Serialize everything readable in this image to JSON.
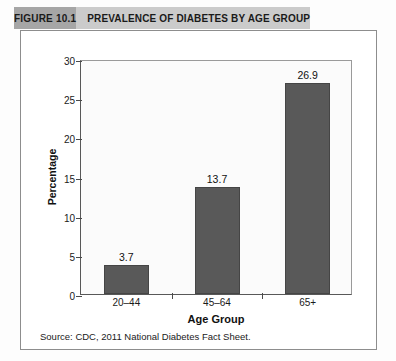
{
  "header": {
    "figure_number": "FIGURE 10.1",
    "title": "PREVALENCE OF DIABETES BY AGE GROUP",
    "number_block_color": "#a6a6a6",
    "title_block_color": "#cbcbcb"
  },
  "source_note": "Source: CDC, 2011 National Diabetes Fact Sheet.",
  "chart_data": {
    "type": "bar",
    "title": "PREVALENCE OF DIABETES BY AGE GROUP",
    "categories": [
      "20–44",
      "45–64",
      "65+"
    ],
    "values": [
      3.7,
      13.7,
      26.9
    ],
    "value_labels": [
      "3.7",
      "13.7",
      "26.9"
    ],
    "xlabel": "Age Group",
    "ylabel": "Percentage",
    "ylim": [
      0,
      30
    ],
    "ytick_values": [
      0,
      5,
      10,
      15,
      20,
      25,
      30
    ],
    "ytick_labels": [
      "0",
      "5",
      "10",
      "15",
      "20",
      "25",
      "30"
    ],
    "grid": false,
    "legend": false,
    "bar_color": "#595959",
    "plot_background": "#fbfbfb"
  }
}
